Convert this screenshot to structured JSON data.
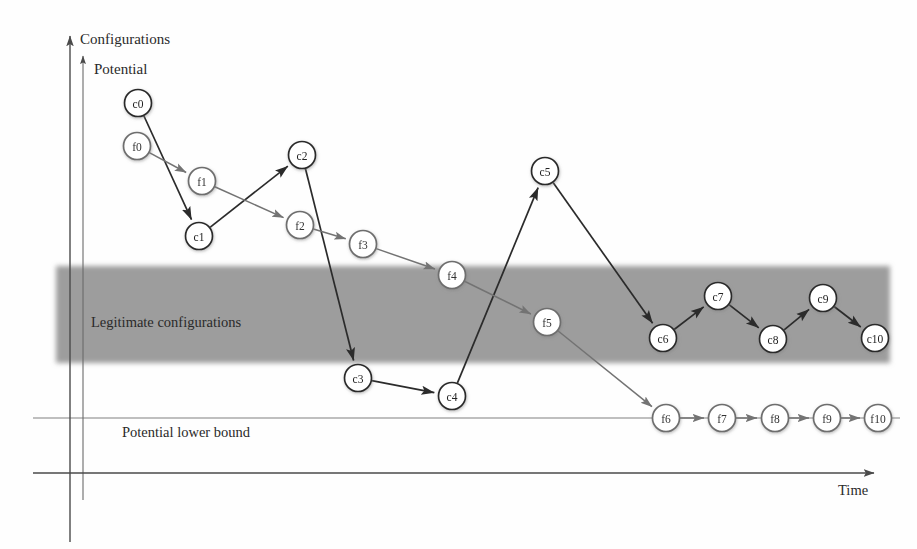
{
  "figure": {
    "axes": {
      "y_outer_label": "Configurations",
      "y_inner_label": "Potential",
      "x_label": "Time"
    },
    "annotations": {
      "band_label": "Legitimate configurations",
      "bound_label": "Potential lower bound"
    },
    "colors": {
      "band_fill": "#9d9d9d",
      "config_stroke": "#2b2b2b",
      "potential_stroke": "#737373",
      "axis_stroke": "#4a4a4a",
      "node_fill": "#ffffff",
      "background": "#fefefe"
    }
  },
  "chart_data": {
    "type": "scatter",
    "xlabel": "Time",
    "ylabel": "Configurations / Potential",
    "grid": false,
    "legend": "none",
    "bands": [
      {
        "name": "legitimate-configurations-band",
        "label": "Legitimate configurations",
        "x_start": 56,
        "x_end": 890,
        "y_top": 266,
        "y_bottom": 363,
        "fill": "#9d9d9d"
      }
    ],
    "reference_lines": [
      {
        "name": "potential-lower-bound",
        "label": "Potential lower bound",
        "y": 418,
        "x_start": 33,
        "x_end": 900
      }
    ],
    "series": [
      {
        "name": "configurations",
        "prefix": "c",
        "stroke": "#2b2b2b",
        "nodes": [
          {
            "id": "c0",
            "label": "c0",
            "x": 138,
            "y": 103
          },
          {
            "id": "c1",
            "label": "c1",
            "x": 199,
            "y": 236
          },
          {
            "id": "c2",
            "label": "c2",
            "x": 302,
            "y": 155
          },
          {
            "id": "c3",
            "label": "c3",
            "x": 358,
            "y": 378
          },
          {
            "id": "c4",
            "label": "c4",
            "x": 452,
            "y": 396
          },
          {
            "id": "c5",
            "label": "c5",
            "x": 545,
            "y": 171
          },
          {
            "id": "c6",
            "label": "c6",
            "x": 663,
            "y": 338
          },
          {
            "id": "c7",
            "label": "c7",
            "x": 718,
            "y": 296
          },
          {
            "id": "c8",
            "label": "c8",
            "x": 773,
            "y": 339
          },
          {
            "id": "c9",
            "label": "c9",
            "x": 823,
            "y": 298
          },
          {
            "id": "c10",
            "label": "c10",
            "x": 875,
            "y": 338
          }
        ],
        "edges": [
          [
            "c0",
            "c1"
          ],
          [
            "c1",
            "c2"
          ],
          [
            "c2",
            "c3"
          ],
          [
            "c3",
            "c4"
          ],
          [
            "c4",
            "c5"
          ],
          [
            "c5",
            "c6"
          ],
          [
            "c6",
            "c7"
          ],
          [
            "c7",
            "c8"
          ],
          [
            "c8",
            "c9"
          ],
          [
            "c9",
            "c10"
          ]
        ]
      },
      {
        "name": "potential",
        "prefix": "f",
        "stroke": "#737373",
        "nodes": [
          {
            "id": "f0",
            "label": "f0",
            "x": 137,
            "y": 146
          },
          {
            "id": "f1",
            "label": "f1",
            "x": 202,
            "y": 181
          },
          {
            "id": "f2",
            "label": "f2",
            "x": 300,
            "y": 225
          },
          {
            "id": "f3",
            "label": "f3",
            "x": 363,
            "y": 244
          },
          {
            "id": "f4",
            "label": "f4",
            "x": 452,
            "y": 275
          },
          {
            "id": "f5",
            "label": "f5",
            "x": 547,
            "y": 322
          },
          {
            "id": "f6",
            "label": "f6",
            "x": 666,
            "y": 418
          },
          {
            "id": "f7",
            "label": "f7",
            "x": 722,
            "y": 418
          },
          {
            "id": "f8",
            "label": "f8",
            "x": 775,
            "y": 418
          },
          {
            "id": "f9",
            "label": "f9",
            "x": 827,
            "y": 418
          },
          {
            "id": "f10",
            "label": "f10",
            "x": 878,
            "y": 418
          }
        ],
        "edges": [
          [
            "f0",
            "f1"
          ],
          [
            "f1",
            "f2"
          ],
          [
            "f2",
            "f3"
          ],
          [
            "f3",
            "f4"
          ],
          [
            "f4",
            "f5"
          ],
          [
            "f5",
            "f6"
          ],
          [
            "f6",
            "f7"
          ],
          [
            "f7",
            "f8"
          ],
          [
            "f8",
            "f9"
          ],
          [
            "f9",
            "f10"
          ]
        ]
      }
    ],
    "node_radius": 13.5
  }
}
